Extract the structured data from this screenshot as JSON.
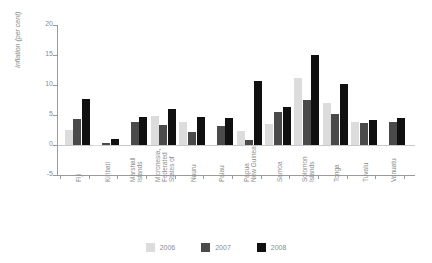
{
  "top_caption": "",
  "chart_data": {
    "type": "bar",
    "title": "",
    "xlabel": "",
    "ylabel": "Inflation (per cent)",
    "ylim": [
      -5,
      20
    ],
    "yticks": [
      20,
      15,
      10,
      5,
      0,
      -5
    ],
    "ytick_labels": [
      "20",
      "15",
      "10",
      "5",
      "0",
      "-5"
    ],
    "grid": false,
    "legend_position": "bottom",
    "categories": [
      "Fiji",
      "Kiribati",
      "Marshall\nIslands",
      "Micronesia,\nFederated\nStates of",
      "Nauru",
      "Palau",
      "Papua\nNew Guinea",
      "Samoa",
      "Solomon\nIslands",
      "Tonga",
      "Tuvalu",
      "Vanuatu"
    ],
    "series": [
      {
        "name": "2006",
        "color": "#dcdcdc",
        "values": [
          2.5,
          -0.2,
          0.0,
          4.8,
          3.8,
          0.0,
          2.4,
          3.5,
          11.2,
          7.0,
          3.9,
          0.0
        ]
      },
      {
        "name": "2007",
        "color": "#4a4a4a",
        "values": [
          4.3,
          0.4,
          3.9,
          3.3,
          2.2,
          3.2,
          0.9,
          5.5,
          7.5,
          5.2,
          3.6,
          3.9
        ]
      },
      {
        "name": "2008",
        "color": "#101010",
        "values": [
          7.7,
          1.0,
          4.6,
          6.0,
          4.6,
          4.5,
          10.7,
          6.4,
          15.0,
          10.1,
          4.1,
          4.5
        ]
      }
    ]
  },
  "legend": {
    "items": [
      {
        "label": "2006",
        "color": "#dcdcdc"
      },
      {
        "label": "2007",
        "color": "#4a4a4a"
      },
      {
        "label": "2008",
        "color": "#101010"
      }
    ]
  }
}
